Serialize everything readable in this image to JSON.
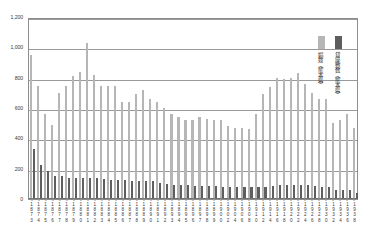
{
  "chart_data": {
    "type": "bar",
    "title": "",
    "xlabel": "",
    "ylabel": "",
    "ylim": [
      0,
      1200
    ],
    "ytick_labels": [
      "0",
      "200",
      "400",
      "600",
      "800",
      "1,000",
      "1,200"
    ],
    "ytick_values": [
      0,
      200,
      400,
      600,
      800,
      1000,
      1200
    ],
    "grid": true,
    "legend_position": "top-right-inside",
    "categories": [
      "1873",
      "1874",
      "1875",
      "1876",
      "1877",
      "1878",
      "1879",
      "1880",
      "1881",
      "1882",
      "1883",
      "1884",
      "1885",
      "1886",
      "1887",
      "1888",
      "1889",
      "1890",
      "1891",
      "1892",
      "1893",
      "1894",
      "1895",
      "1896",
      "1897",
      "1898",
      "1899",
      "1900",
      "1902",
      "1904",
      "1906",
      "1908",
      "1910",
      "1912",
      "1914",
      "1916",
      "1918",
      "1920",
      "1922",
      "1924",
      "1926",
      "1928",
      "1930",
      "1932",
      "1934",
      "1936",
      "1938"
    ],
    "xtick_labels": [
      "1873",
      "1875",
      "1877",
      "1879",
      "1881",
      "1883",
      "1885",
      "1887",
      "1889",
      "1891",
      "1893",
      "1895",
      "1897",
      "1899",
      "1902",
      "1906",
      "1910",
      "1914",
      "1918",
      "1922",
      "1926",
      "1930",
      "1932",
      "1934",
      "1936",
      "1938"
    ],
    "series": [
      {
        "name": "娼妓（熊本県）",
        "color": "#b6b6b6",
        "values": [
          950,
          742,
          560,
          488,
          700,
          742,
          810,
          840,
          1030,
          818,
          742,
          742,
          742,
          640,
          640,
          690,
          718,
          660,
          640,
          600,
          560,
          540,
          520,
          522,
          540,
          530,
          520,
          520,
          480,
          470,
          470,
          462,
          560,
          690,
          740,
          800,
          790,
          800,
          830,
          760,
          700,
          660,
          660,
          500,
          520,
          560,
          470
        ]
      },
      {
        "name": "貸座敷数（熊本県）",
        "color": "#5e5e5e",
        "values": [
          330,
          222,
          188,
          150,
          150,
          140,
          140,
          136,
          138,
          140,
          134,
          128,
          124,
          124,
          122,
          122,
          120,
          118,
          108,
          96,
          92,
          90,
          90,
          88,
          86,
          84,
          84,
          82,
          80,
          78,
          78,
          76,
          76,
          80,
          86,
          90,
          90,
          92,
          92,
          90,
          86,
          80,
          76,
          62,
          60,
          58,
          40
        ]
      }
    ]
  }
}
